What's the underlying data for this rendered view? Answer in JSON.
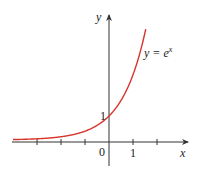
{
  "chart_data": {
    "type": "line",
    "title": "",
    "series": [
      {
        "name": "y = e^x",
        "function": "exp(x)",
        "color": "#d9342b",
        "x": [
          -4,
          -3,
          -2,
          -1,
          0,
          1,
          1.5
        ],
        "values": [
          0.018,
          0.05,
          0.135,
          0.368,
          1,
          2.718,
          4.48
        ]
      }
    ],
    "xlabel": "x",
    "ylabel": "y",
    "x_ticks": [
      -4,
      -3,
      -2,
      -1,
      0,
      1,
      2
    ],
    "x_tick_labels": {
      "0": "0",
      "1": "1"
    },
    "y_tick_labels": {
      "1": "1"
    },
    "annotation": {
      "text_main": "y = e",
      "text_sup": "x"
    },
    "xlim": [
      -4,
      3.3
    ],
    "ylim": [
      -1.2,
      5.4
    ],
    "grid": false,
    "legend": "none"
  },
  "labels": {
    "y_axis": "y",
    "x_axis": "x",
    "origin": "0",
    "x_one": "1",
    "y_one": "1",
    "curve_main": "y = e",
    "curve_sup": "x"
  },
  "colors": {
    "curve": "#d9342b",
    "axis": "#333333"
  }
}
